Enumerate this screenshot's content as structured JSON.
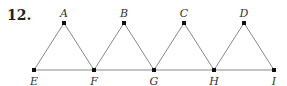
{
  "problem_number": "12.",
  "colors": {
    "line": "#8a8a8a",
    "point": "#111111",
    "text": "#333333"
  },
  "points": [
    {
      "label": "A",
      "x": 64,
      "y": 23,
      "label_pos": "above"
    },
    {
      "label": "B",
      "x": 124,
      "y": 23,
      "label_pos": "above"
    },
    {
      "label": "C",
      "x": 184,
      "y": 23,
      "label_pos": "above"
    },
    {
      "label": "D",
      "x": 244,
      "y": 23,
      "label_pos": "above"
    },
    {
      "label": "E",
      "x": 34,
      "y": 70,
      "label_pos": "below"
    },
    {
      "label": "F",
      "x": 94,
      "y": 70,
      "label_pos": "below"
    },
    {
      "label": "G",
      "x": 154,
      "y": 70,
      "label_pos": "below"
    },
    {
      "label": "H",
      "x": 214,
      "y": 70,
      "label_pos": "below"
    },
    {
      "label": "I",
      "x": 274,
      "y": 70,
      "label_pos": "below"
    }
  ],
  "segments": [
    [
      "E",
      "I"
    ],
    [
      "E",
      "A"
    ],
    [
      "A",
      "F"
    ],
    [
      "F",
      "B"
    ],
    [
      "B",
      "G"
    ],
    [
      "G",
      "C"
    ],
    [
      "C",
      "H"
    ],
    [
      "H",
      "D"
    ],
    [
      "D",
      "I"
    ]
  ]
}
